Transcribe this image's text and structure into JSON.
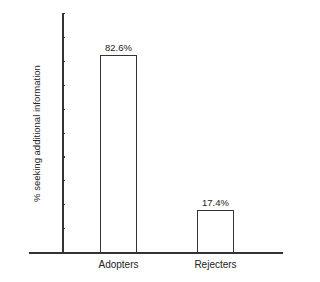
{
  "chart_data": {
    "type": "bar",
    "title": "",
    "xlabel": "",
    "ylabel": "% seeking additional information",
    "categories": [
      "Adopters",
      "Rejecters"
    ],
    "values": [
      82.6,
      17.4
    ],
    "value_labels": [
      "82.6%",
      "17.4%"
    ],
    "ylim": [
      0,
      100
    ],
    "yticks_labeled": false,
    "ytick_count": 10,
    "grid": false,
    "legend": null
  }
}
